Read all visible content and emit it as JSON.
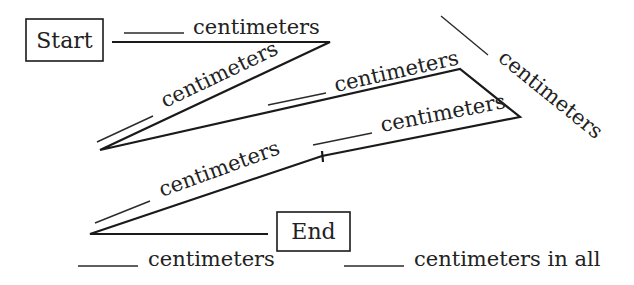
{
  "diagram": {
    "start_label": "Start",
    "end_label": "End",
    "unit": "centimeters",
    "segments": [
      {
        "id": 1,
        "label": "centimeters",
        "blank": "____"
      },
      {
        "id": 2,
        "label": "centimeters",
        "blank": "____"
      },
      {
        "id": 3,
        "label": "centimeters",
        "blank": "____"
      },
      {
        "id": 4,
        "label": "centimeters",
        "blank": "____"
      },
      {
        "id": 5,
        "label": "centimeters",
        "blank": "____"
      },
      {
        "id": 6,
        "label": "centimeters",
        "blank": "____"
      },
      {
        "id": 7,
        "label": "centimeters",
        "blank": "____"
      }
    ],
    "total_label": "centimeters in all",
    "colors": {
      "ink": "#1a1a1a",
      "background": "#ffffff"
    }
  }
}
